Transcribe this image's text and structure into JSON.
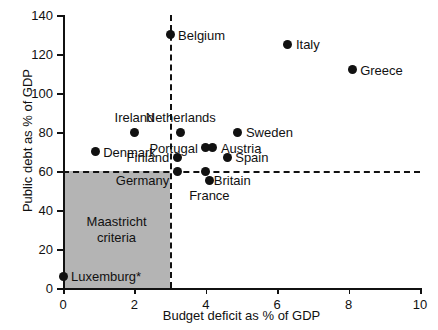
{
  "chart_data": {
    "type": "scatter",
    "title": "",
    "xlabel": "Budget deficit as % of GDP",
    "ylabel": "Public debt as % of GDP",
    "xlim": [
      0,
      10
    ],
    "ylim": [
      0,
      140
    ],
    "xticks": [
      0,
      2,
      4,
      6,
      8,
      10
    ],
    "yticks": [
      0,
      20,
      40,
      60,
      80,
      100,
      120,
      140
    ],
    "grid": false,
    "legend": "none",
    "point_color": "#111111",
    "shaded_region_color": "#b4b4b4",
    "annotations": {
      "maastricht_line1": "Maastricht",
      "maastricht_line2": "criteria",
      "maastricht_x_threshold": 3,
      "maastricht_y_threshold": 60
    },
    "reference_lines": [
      {
        "name": "deficit-threshold",
        "orientation": "vertical",
        "value": 3,
        "style": "dashed"
      },
      {
        "name": "debt-threshold",
        "orientation": "horizontal",
        "value": 60,
        "style": "dashed"
      }
    ],
    "points": [
      {
        "label": "Luxemburg*",
        "x": 0.0,
        "y": 6,
        "label_pos": "right"
      },
      {
        "label": "Denmark",
        "x": 0.9,
        "y": 70,
        "label_pos": "right"
      },
      {
        "label": "Ireland",
        "x": 2.0,
        "y": 80,
        "label_pos": "above"
      },
      {
        "label": "Belgium",
        "x": 3.0,
        "y": 130,
        "label_pos": "right"
      },
      {
        "label": "Finland",
        "x": 3.2,
        "y": 67,
        "label_pos": "left"
      },
      {
        "label": "Germany",
        "x": 3.2,
        "y": 60,
        "label_pos": "below-left"
      },
      {
        "label": "Netherlands",
        "x": 3.3,
        "y": 80,
        "label_pos": "above"
      },
      {
        "label": "Portugal",
        "x": 4.0,
        "y": 72,
        "label_pos": "left"
      },
      {
        "label": "Britain",
        "x": 4.0,
        "y": 60,
        "label_pos": "below-right"
      },
      {
        "label": "France",
        "x": 4.1,
        "y": 55,
        "label_pos": "below"
      },
      {
        "label": "Austria",
        "x": 4.2,
        "y": 72,
        "label_pos": "right"
      },
      {
        "label": "Spain",
        "x": 4.6,
        "y": 67,
        "label_pos": "right"
      },
      {
        "label": "Sweden",
        "x": 4.9,
        "y": 80,
        "label_pos": "right"
      },
      {
        "label": "Italy",
        "x": 6.3,
        "y": 125,
        "label_pos": "right"
      },
      {
        "label": "Greece",
        "x": 8.1,
        "y": 112,
        "label_pos": "right"
      }
    ]
  }
}
